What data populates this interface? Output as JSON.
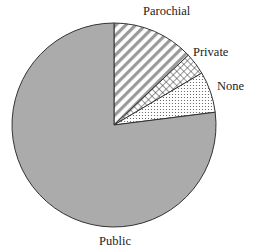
{
  "chart_data": {
    "type": "pie",
    "title": "",
    "start_angle_deg": 0,
    "direction": "clockwise",
    "slices": [
      {
        "label": "Parochial",
        "value": 13.0,
        "pattern": "diagonal-stripes"
      },
      {
        "label": "Private",
        "value": 3.5,
        "pattern": "crosshatch"
      },
      {
        "label": "None",
        "value": 6.5,
        "pattern": "dots"
      },
      {
        "label": "Public",
        "value": 77.0,
        "pattern": "solid-gray"
      }
    ],
    "colors": {
      "public_fill": "#ababab",
      "outline": "#333333",
      "stripe": "#9a9a9a",
      "hatch": "#333333",
      "dots": "#555555"
    }
  },
  "labels": {
    "parochial": "Parochial",
    "private": "Private",
    "none": "None",
    "public": "Public"
  }
}
